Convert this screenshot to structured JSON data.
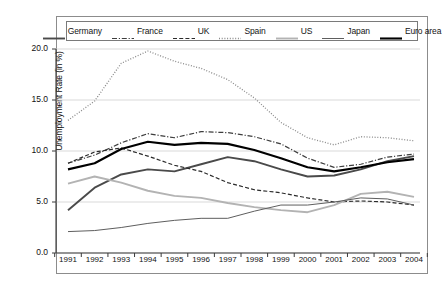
{
  "chart_data": {
    "type": "line",
    "title": "",
    "xlabel": "",
    "ylabel": "Unemployment Rate (in %)",
    "categories": [
      "1991",
      "1992",
      "1993",
      "1994",
      "1995",
      "1996",
      "1997",
      "1998",
      "1999",
      "2000",
      "2001",
      "2002",
      "2003",
      "2004"
    ],
    "x": [
      1991,
      1992,
      1993,
      1994,
      1995,
      1996,
      1997,
      1998,
      1999,
      2000,
      2001,
      2002,
      2003,
      2004
    ],
    "ylim": [
      0.0,
      20.0
    ],
    "yticks": [
      "0.0",
      "5.0",
      "10.0",
      "15.0",
      "20.0"
    ],
    "ytick_values": [
      0.0,
      5.0,
      10.0,
      15.0,
      20.0
    ],
    "grid": "horizontal",
    "legend_position": "top",
    "series": [
      {
        "name": "Germany",
        "style": "solid",
        "color": "#4a4a4a",
        "width": 1.9,
        "values": [
          4.2,
          6.4,
          7.7,
          8.2,
          8.0,
          8.7,
          9.4,
          9.0,
          8.2,
          7.5,
          7.6,
          8.2,
          9.0,
          9.5
        ]
      },
      {
        "name": "France",
        "style": "dashdot",
        "color": "#3d3d3d",
        "width": 1.2,
        "values": [
          8.8,
          9.6,
          10.8,
          11.7,
          11.3,
          11.9,
          11.8,
          11.4,
          10.7,
          9.3,
          8.4,
          8.7,
          9.4,
          9.7
        ]
      },
      {
        "name": "UK",
        "style": "dashed",
        "color": "#2b2b2b",
        "width": 1.2,
        "values": [
          8.8,
          9.9,
          10.3,
          9.5,
          8.6,
          8.0,
          6.9,
          6.2,
          5.9,
          5.4,
          5.0,
          5.1,
          5.0,
          4.7
        ]
      },
      {
        "name": "Spain",
        "style": "dotted",
        "color": "#8a8a8a",
        "width": 1.3,
        "values": [
          13.0,
          14.9,
          18.6,
          19.8,
          18.8,
          18.1,
          17.0,
          15.2,
          12.8,
          11.3,
          10.6,
          11.4,
          11.3,
          11.0
        ]
      },
      {
        "name": "US",
        "style": "solid",
        "color": "#b3b3b3",
        "width": 1.9,
        "values": [
          6.8,
          7.5,
          6.9,
          6.1,
          5.6,
          5.4,
          4.9,
          4.5,
          4.2,
          4.0,
          4.7,
          5.8,
          6.0,
          5.5
        ]
      },
      {
        "name": "Japan",
        "style": "solid",
        "color": "#5e5e5e",
        "width": 1.0,
        "values": [
          2.1,
          2.2,
          2.5,
          2.9,
          3.2,
          3.4,
          3.4,
          4.1,
          4.7,
          4.7,
          5.0,
          5.4,
          5.3,
          4.7
        ]
      },
      {
        "name": "Euro area",
        "style": "solid",
        "color": "#000000",
        "width": 2.1,
        "values": [
          8.2,
          8.8,
          10.2,
          10.9,
          10.6,
          10.8,
          10.7,
          10.1,
          9.3,
          8.4,
          8.0,
          8.4,
          8.9,
          9.2
        ]
      }
    ]
  }
}
